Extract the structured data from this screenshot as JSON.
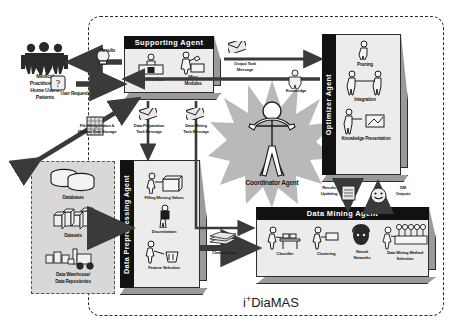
{
  "system": {
    "logo_prefix": "i",
    "logo_sup": "+",
    "logo_suffix": "DiaMAS",
    "boundary_style": "dashed-rounded"
  },
  "actors": {
    "users": {
      "line1": "Medical",
      "line2": "Practitioners/",
      "line3": "Home Users/",
      "line4": "Patients",
      "icon": "people-icon"
    }
  },
  "data_sources": {
    "items": [
      {
        "label": "Databases",
        "icon": "database-cylinders-icon"
      },
      {
        "label": "Datasets",
        "icon": "data-blocks-icon"
      },
      {
        "label_line1": "Data Warehouse/",
        "label_line2": "Data Repositories",
        "icon": "warehouse-forklift-icon"
      }
    ]
  },
  "agents": {
    "supporting": {
      "title": "Supporting Agent",
      "modules": [
        {
          "line1": "User Interface",
          "line2": "",
          "icon": "user-interface-icon"
        },
        {
          "line1": "Misc",
          "line2": "Modules",
          "icon": "misc-modules-icon"
        }
      ]
    },
    "optimizer": {
      "title": "Optimizer Agent",
      "modules": [
        {
          "label": "Pruning",
          "icon": "pruning-icon"
        },
        {
          "label": "Integration",
          "icon": "integration-icon"
        },
        {
          "label": "Knowledge Presentation",
          "icon": "knowledge-presentation-icon"
        }
      ]
    },
    "preprocessing": {
      "title": "Data Preprocessing Agent",
      "modules": [
        {
          "label": "Filling Missing Values",
          "icon": "filling-missing-values-icon"
        },
        {
          "label": "Discretization",
          "icon": "discretization-icon"
        },
        {
          "label": "Feature Selection",
          "icon": "feature-selection-icon"
        }
      ]
    },
    "mining": {
      "title": "Data Mining Agent",
      "modules": [
        {
          "line1": "Classifier",
          "line2": "",
          "icon": "classifier-icon"
        },
        {
          "line1": "Clustering",
          "line2": "",
          "icon": "clustering-icon"
        },
        {
          "line1": "Neural",
          "line2": "Networks",
          "icon": "neural-networks-icon"
        },
        {
          "line1": "Data Mining Method",
          "line2": "Selection",
          "icon": "dm-method-selection-icon"
        }
      ]
    },
    "coordinator": {
      "title": "Coordinator Agent",
      "icon": "person-star-icon"
    }
  },
  "flows": {
    "results": {
      "label": "Results",
      "icon": "lightbulb-icon"
    },
    "user_request": {
      "label": "User Request",
      "icon": "question-mark-icon"
    },
    "file_manipulation": {
      "line1": "File Manipulation &",
      "line2": "Mediate Data Storage",
      "icon": "file-grid-icon"
    },
    "data_preparation_task": {
      "line1": "Data Preparation",
      "line2": "Task Message",
      "icon": "envelope-icon"
    },
    "data_mining_task": {
      "line1": "Data Mining",
      "line2": "Task Message",
      "icon": "envelope-icon"
    },
    "output_task": {
      "line1": "Output Task",
      "line2": "Message",
      "icon": "envelope-icon"
    },
    "knowledge": {
      "label": "Knowledge",
      "icon": "knowledge-person-icon"
    },
    "cleaned_data": {
      "label": "Cleaned Data",
      "icon": "stacked-sheets-icon"
    },
    "results_updating": {
      "line1": "Results",
      "line2": "Updating",
      "icon": "results-update-icon"
    },
    "dm_outputs": {
      "line1": "DM",
      "line2": "Outputs",
      "icon": "smiley-icon"
    }
  },
  "colors": {
    "header_bg": "#111111",
    "box_face": "#ececec",
    "box_side": "#9a9a9a",
    "group_bg": "#d8d8d8",
    "burst": "#b8b8b8",
    "arrow": "#3a3a3a"
  }
}
